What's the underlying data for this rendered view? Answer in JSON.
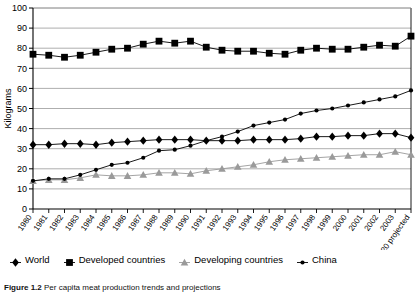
{
  "figure": {
    "caption_label": "Figure 1.2",
    "caption_text": "Per capita meat production trends and projections"
  },
  "chart_data": {
    "type": "line",
    "title": "",
    "xlabel": "",
    "ylabel": "Kilograms",
    "ylim": [
      0,
      100
    ],
    "ytick_values": [
      0,
      10,
      20,
      30,
      40,
      50,
      60,
      70,
      80,
      90,
      100
    ],
    "grid": true,
    "legend_position": "bottom",
    "categories": [
      "1980",
      "1981",
      "1982",
      "1983",
      "1984",
      "1985",
      "1986",
      "1987",
      "1988",
      "1989",
      "1990",
      "1991",
      "1992",
      "1993",
      "1994",
      "1995",
      "1996",
      "1997",
      "1998",
      "1999",
      "2000",
      "2001",
      "2002",
      "2003",
      "2020 projected"
    ],
    "series": [
      {
        "name": "World",
        "marker": "diamond",
        "color": "#000000",
        "values": [
          32,
          32,
          32.5,
          32.5,
          32,
          33,
          33.5,
          34,
          34.5,
          34.5,
          34.5,
          34,
          34,
          34,
          34.5,
          34.5,
          34.5,
          35,
          36,
          36,
          36.5,
          36.5,
          37.5,
          37.5,
          35.5
        ]
      },
      {
        "name": "Developed countries",
        "marker": "square",
        "color": "#000000",
        "values": [
          77,
          76.5,
          75.5,
          76.5,
          78,
          79.5,
          80,
          82,
          83.5,
          82.5,
          83.5,
          80.5,
          79,
          78.5,
          78.5,
          77.5,
          77,
          79,
          80,
          79.5,
          79.5,
          80.5,
          81.5,
          81,
          86
        ]
      },
      {
        "name": "Developing countries",
        "marker": "triangle",
        "color": "#9a9a9a",
        "values": [
          14,
          14.5,
          14.5,
          15.5,
          17,
          16.5,
          16.5,
          17,
          18,
          18,
          17.5,
          19,
          20,
          21,
          22,
          23.5,
          24.5,
          25,
          25.5,
          26,
          26.5,
          27,
          27,
          28.5,
          27
        ]
      },
      {
        "name": "China",
        "marker": "circle",
        "color": "#000000",
        "values": [
          14,
          15,
          15,
          17,
          19.5,
          22,
          23,
          25.5,
          29,
          29.5,
          31.5,
          34,
          36,
          38.5,
          41.5,
          43,
          44.5,
          47.5,
          49,
          50,
          51.5,
          53,
          54.5,
          56,
          59
        ]
      }
    ]
  }
}
